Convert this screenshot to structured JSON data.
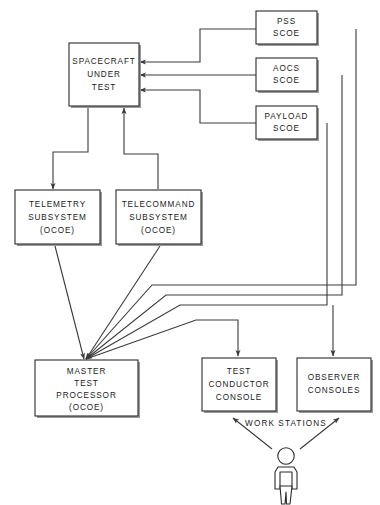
{
  "diagram": {
    "boxes": {
      "spacecraft": {
        "lines": [
          "SPACECRAFT",
          "UNDER",
          "TEST"
        ]
      },
      "pss_scoe": {
        "lines": [
          "PSS",
          "SCOE"
        ]
      },
      "aocs_scoe": {
        "lines": [
          "AOCS",
          "SCOE"
        ]
      },
      "payload_scoe": {
        "lines": [
          "PAYLOAD",
          "SCOE"
        ]
      },
      "telemetry": {
        "lines": [
          "TELEMETRY",
          "SUBSYSTEM",
          "(OCOE)"
        ]
      },
      "telecommand": {
        "lines": [
          "TELECOMMAND",
          "SUBSYSTEM",
          "(OCOE)"
        ]
      },
      "master_test_processor": {
        "lines": [
          "MASTER",
          "TEST",
          "PROCESSOR",
          "(OCOE)"
        ]
      },
      "test_conductor_console": {
        "lines": [
          "TEST",
          "CONDUCTOR",
          "CONSOLE"
        ]
      },
      "observer_consoles": {
        "lines": [
          "OBSERVER",
          "CONSOLES"
        ]
      }
    },
    "labels": {
      "work_stations": "WORK STATIONS"
    },
    "colors": {
      "line": "#3a3a3a",
      "box_border": "#2b2b2b",
      "box_fill": "#ffffff",
      "shadow": "#9a9a9a",
      "text": "#1a1a1a",
      "background": "#ffffff"
    }
  }
}
